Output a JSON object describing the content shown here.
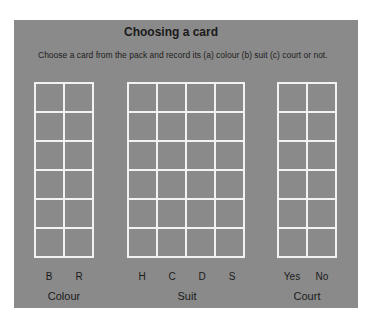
{
  "title": "Choosing a card",
  "instruction": "Choose a card from the pack and record its (a) colour (b) suit (c) court or not.",
  "groups": [
    {
      "name": "Colour",
      "columns": [
        "B",
        "R"
      ],
      "rows": 6
    },
    {
      "name": "Suit",
      "columns": [
        "H",
        "C",
        "D",
        "S"
      ],
      "rows": 6
    },
    {
      "name": "Court",
      "columns": [
        "Yes",
        "No"
      ],
      "rows": 6
    }
  ],
  "colors": {
    "panel": "#8a8a8a",
    "grid_lines": "#f2f2f2",
    "text": "#1a1a1a"
  }
}
